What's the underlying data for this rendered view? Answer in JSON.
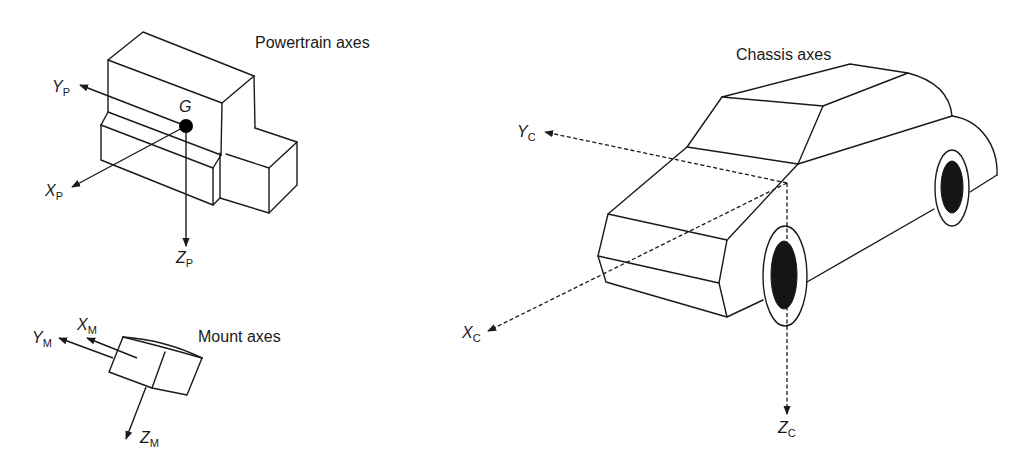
{
  "diagram": {
    "type": "technical-illustration",
    "groups": {
      "powertrain": {
        "caption": "Powertrain axes",
        "center_point_label": "G",
        "axes": [
          {
            "main": "Y",
            "sub": "P"
          },
          {
            "main": "X",
            "sub": "P"
          },
          {
            "main": "Z",
            "sub": "P"
          }
        ]
      },
      "mount": {
        "caption": "Mount axes",
        "axes": [
          {
            "main": "Y",
            "sub": "M"
          },
          {
            "main": "X",
            "sub": "M"
          },
          {
            "main": "Z",
            "sub": "M"
          }
        ]
      },
      "chassis": {
        "caption": "Chassis axes",
        "axes": [
          {
            "main": "Y",
            "sub": "C"
          },
          {
            "main": "X",
            "sub": "C"
          },
          {
            "main": "Z",
            "sub": "C"
          }
        ]
      }
    },
    "colors": {
      "line": "#1a1a1a",
      "background": "#ffffff",
      "wheel_hub": "#151515"
    }
  }
}
